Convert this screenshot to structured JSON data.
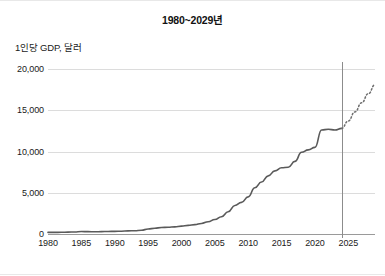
{
  "chart_data": {
    "type": "line",
    "title": "1980~2029년",
    "ylabel": "1인당 GDP, 달러",
    "xlabel": "",
    "xlim": [
      1980,
      2029
    ],
    "ylim": [
      0,
      20000
    ],
    "grid": true,
    "legend": false,
    "y_ticks": [
      "0",
      "5,000",
      "10,000",
      "15,000",
      "20,000"
    ],
    "y_tick_values": [
      0,
      5000,
      10000,
      15000,
      20000
    ],
    "x_ticks": [
      "1980",
      "1985",
      "1990",
      "1995",
      "2000",
      "2005",
      "2010",
      "2015",
      "2020",
      "2025"
    ],
    "x_tick_values": [
      1980,
      1985,
      1990,
      1995,
      2000,
      2005,
      2010,
      2015,
      2020,
      2025
    ],
    "annotations": [
      {
        "name": "forecast-divider",
        "type": "vline",
        "x": 2024
      }
    ],
    "series": [
      {
        "name": "actual",
        "style": "solid",
        "color": "#5a5a5a",
        "x": [
          1980,
          1981,
          1982,
          1983,
          1984,
          1985,
          1986,
          1987,
          1988,
          1989,
          1990,
          1991,
          1992,
          1993,
          1994,
          1995,
          1996,
          1997,
          1998,
          1999,
          2000,
          2001,
          2002,
          2003,
          2004,
          2005,
          2006,
          2007,
          2008,
          2009,
          2010,
          2011,
          2012,
          2013,
          2014,
          2015,
          2016,
          2017,
          2018,
          2019,
          2020,
          2021,
          2022,
          2023,
          2024
        ],
        "values": [
          195,
          200,
          205,
          230,
          250,
          295,
          285,
          270,
          290,
          310,
          320,
          340,
          375,
          400,
          460,
          600,
          700,
          780,
          820,
          865,
          955,
          1045,
          1140,
          1280,
          1490,
          1750,
          2100,
          2690,
          3460,
          3830,
          4500,
          5600,
          6300,
          7050,
          7650,
          8030,
          8100,
          8800,
          9900,
          10200,
          10500,
          12600,
          12700,
          12600,
          12800
        ]
      },
      {
        "name": "forecast",
        "style": "dotted",
        "color": "#6e6e6e",
        "x": [
          2024,
          2025,
          2026,
          2027,
          2028,
          2029
        ],
        "values": [
          12800,
          13700,
          14800,
          15900,
          17000,
          18100
        ]
      }
    ]
  }
}
